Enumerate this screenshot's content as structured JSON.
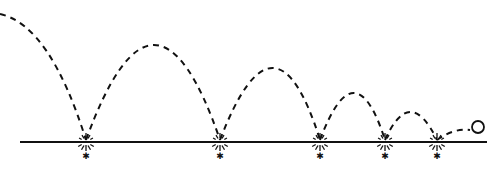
{
  "diagram": {
    "title": "",
    "colors": {
      "ink": "#111111",
      "background": "#ffffff"
    },
    "ground": {
      "x1": 20,
      "x2": 487,
      "y": 142
    },
    "ball": {
      "cx": 478,
      "cy": 127,
      "r": 6
    },
    "trajectory": [
      {
        "from": [
          0,
          14
        ],
        "to": [
          86,
          140
        ],
        "control": [
          50,
          25
        ],
        "kind": "fall"
      },
      {
        "from": [
          86,
          140
        ],
        "to": [
          220,
          140
        ],
        "peak": [
          155,
          45
        ],
        "kind": "bounce"
      },
      {
        "from": [
          220,
          140
        ],
        "to": [
          320,
          140
        ],
        "peak": [
          275,
          68
        ],
        "kind": "bounce"
      },
      {
        "from": [
          320,
          140
        ],
        "to": [
          385,
          140
        ],
        "peak": [
          355,
          93
        ],
        "kind": "bounce"
      },
      {
        "from": [
          385,
          140
        ],
        "to": [
          437,
          140
        ],
        "peak": [
          410,
          112
        ],
        "kind": "bounce"
      },
      {
        "from": [
          437,
          140
        ],
        "to": [
          470,
          130
        ],
        "kind": "rise"
      }
    ],
    "impacts": [
      {
        "x": 86
      },
      {
        "x": 220
      },
      {
        "x": 320
      },
      {
        "x": 385
      },
      {
        "x": 437
      }
    ]
  }
}
